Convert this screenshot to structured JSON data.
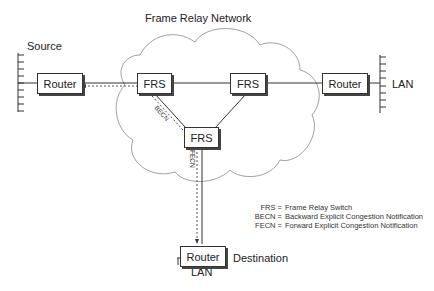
{
  "title": "Frame Relay Network",
  "labels": {
    "source": "Source",
    "lan_right": "LAN",
    "destination": "Destination",
    "lan_bottom": "LAN",
    "becn": "BECN",
    "fecn": "FECN"
  },
  "nodes": {
    "router_source": "Router",
    "frs_left": "FRS",
    "frs_right": "FRS",
    "frs_bottom": "FRS",
    "router_right": "Router",
    "router_destination": "Router"
  },
  "legend": [
    {
      "key": "FRS =",
      "value": "Frame Relay Switch"
    },
    {
      "key": "BECN =",
      "value": "Backward Explicit Congestion Notification"
    },
    {
      "key": "FECN =",
      "value": "Forward Explicit Congestion Notification"
    }
  ]
}
